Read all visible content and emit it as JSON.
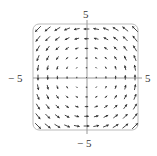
{
  "chart_data": {
    "type": "vector_field",
    "title": "",
    "field": "F(x,y) = (-y, x)",
    "xlim": [
      -5,
      5
    ],
    "ylim": [
      -5,
      5
    ],
    "grid_points_per_axis": 11,
    "tick_labels": {
      "top": "5",
      "bottom": "-5",
      "left": "-5",
      "right": "5"
    },
    "axes_color": "#999999",
    "arrow_color": "#333333",
    "frame_color": "#bbbbbb"
  },
  "labels": {
    "top": "5",
    "bottom": "− 5",
    "left": "− 5",
    "right": "5"
  }
}
